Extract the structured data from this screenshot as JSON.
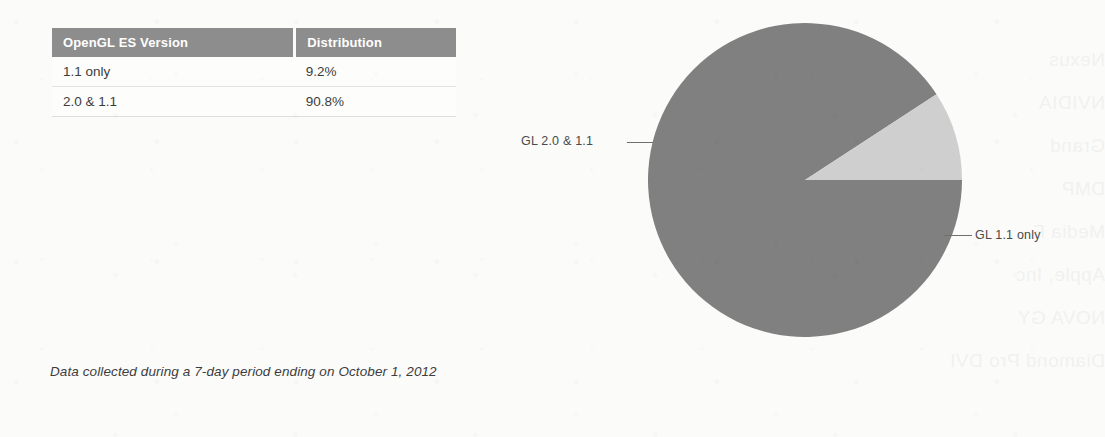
{
  "table": {
    "headers": [
      "OpenGL ES Version",
      "Distribution"
    ],
    "rows": [
      {
        "version": "1.1 only",
        "distribution": "9.2%"
      },
      {
        "version": "2.0 & 1.1",
        "distribution": "90.8%"
      }
    ]
  },
  "caption": "Data collected during a 7-day period ending on October 1, 2012",
  "chart_data": {
    "type": "pie",
    "title": "",
    "categories": [
      "GL 2.0 & 1.1",
      "GL 1.1 only"
    ],
    "values": [
      90.8,
      9.2
    ],
    "unit": "%",
    "labels": {
      "major": "GL 2.0 & 1.1",
      "minor": "GL 1.1 only"
    },
    "colors": [
      "#808080",
      "#cfcfcf"
    ],
    "start_angle_deg": 0,
    "direction": "clockwise",
    "legend": "leader-lines",
    "grid": false
  },
  "colors": {
    "header_bar": "#8d8d8d",
    "slice_major": "#808080",
    "slice_minor": "#cfcfcf",
    "page_background": "#fbfbfa",
    "text": "#3c3c3c"
  },
  "ghost_text": [
    "Nexus",
    "NVIDIA",
    "Grand",
    "DMP",
    "Media F",
    "Apple, Inc",
    "NOVA GY",
    "Diamond Pro DVI"
  ]
}
